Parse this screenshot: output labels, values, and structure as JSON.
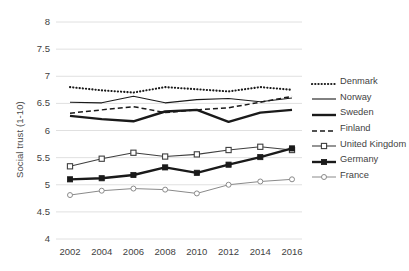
{
  "chart_data": {
    "type": "line",
    "title": "",
    "xlabel": "",
    "ylabel": "Social trust (1-10)",
    "x": [
      2002,
      2004,
      2006,
      2008,
      2010,
      2012,
      2014,
      2016
    ],
    "xtick_labels": [
      "2002",
      "2004",
      "2006",
      "2008",
      "2010",
      "2012",
      "2014",
      "2016"
    ],
    "ytick_labels": [
      "4",
      "4.5",
      "5",
      "5.5",
      "6",
      "6.5",
      "7",
      "7.5",
      "8"
    ],
    "ylim": [
      4,
      8
    ],
    "ytick_step": 0.5,
    "grid": "horizontal",
    "legend_position": "right",
    "series": [
      {
        "name": "Denmark",
        "style": "dotted",
        "marker": "none",
        "color": "#1a1a1a",
        "values": [
          6.8,
          6.74,
          6.7,
          6.8,
          6.76,
          6.72,
          6.8,
          6.75
        ]
      },
      {
        "name": "Norway",
        "style": "solid-thin",
        "marker": "none",
        "color": "#1a1a1a",
        "values": [
          6.52,
          6.51,
          6.63,
          6.51,
          6.57,
          6.59,
          6.53,
          6.6
        ]
      },
      {
        "name": "Sweden",
        "style": "solid-thick",
        "marker": "none",
        "color": "#1a1a1a",
        "values": [
          6.27,
          6.21,
          6.17,
          6.35,
          6.38,
          6.16,
          6.33,
          6.38
        ]
      },
      {
        "name": "Finland",
        "style": "dashed",
        "marker": "none",
        "color": "#1a1a1a",
        "values": [
          6.32,
          6.38,
          6.44,
          6.33,
          6.38,
          6.42,
          6.52,
          6.63
        ]
      },
      {
        "name": "United Kingdom",
        "style": "solid-thin",
        "marker": "open-square",
        "color": "#3f3f3f",
        "values": [
          5.34,
          5.48,
          5.59,
          5.52,
          5.56,
          5.64,
          5.7,
          5.64
        ]
      },
      {
        "name": "Germany",
        "style": "solid-thick",
        "marker": "filled-square",
        "color": "#1a1a1a",
        "values": [
          5.1,
          5.12,
          5.18,
          5.32,
          5.22,
          5.37,
          5.51,
          5.67
        ]
      },
      {
        "name": "France",
        "style": "solid-light",
        "marker": "open-circle",
        "color": "#8a8a8a",
        "values": [
          4.81,
          4.89,
          4.93,
          4.91,
          4.84,
          5.0,
          5.06,
          5.1
        ]
      }
    ]
  },
  "legend": {
    "items": [
      {
        "label": "Denmark"
      },
      {
        "label": "Norway"
      },
      {
        "label": "Sweden"
      },
      {
        "label": "Finland"
      },
      {
        "label": "United Kingdom"
      },
      {
        "label": "Germany"
      },
      {
        "label": "France"
      }
    ]
  },
  "colors": {
    "grid": "#e0e0e0",
    "text": "#3f3f3f",
    "background": "#ffffff"
  }
}
